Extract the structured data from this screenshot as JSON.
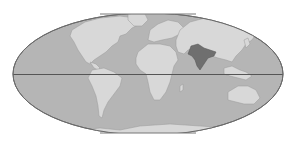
{
  "map": {
    "projection": "elliptical world map",
    "highlighted_region": "South Asia (India)",
    "features": [
      "ocean",
      "continents",
      "equator line",
      "highlighted region"
    ],
    "colors": {
      "background": "#ffffff",
      "ocean": "#b5b5b5",
      "land": "#d8d8d8",
      "highlight": "#6f6f6f",
      "outline": "#777777",
      "equator": "#555555"
    }
  }
}
